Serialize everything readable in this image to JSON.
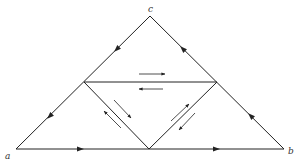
{
  "diagram": {
    "type": "subdivided-triangle",
    "colors": {
      "line": "#222222",
      "background": "#ffffff"
    },
    "vertices": {
      "a": {
        "label": "a",
        "x": 16,
        "y": 149,
        "label_x": 5,
        "label_y": 159
      },
      "b": {
        "label": "b",
        "x": 284,
        "y": 149,
        "label_x": 288,
        "label_y": 154
      },
      "c": {
        "label": "c",
        "x": 150,
        "y": 16,
        "label_x": 148,
        "label_y": 12
      }
    },
    "midpoints": {
      "ac": {
        "x": 84,
        "y": 82
      },
      "bc": {
        "x": 217,
        "y": 82
      },
      "ab": {
        "x": 149,
        "y": 149
      }
    },
    "edge_arrows": [
      {
        "name": "arrow-ca-upper",
        "x": 117,
        "y": 49,
        "angle": 135
      },
      {
        "name": "arrow-ca-lower",
        "x": 50,
        "y": 116,
        "angle": 135
      },
      {
        "name": "arrow-bc-lower",
        "x": 251,
        "y": 116,
        "angle": -135
      },
      {
        "name": "arrow-bc-upper",
        "x": 183,
        "y": 49,
        "angle": -135
      },
      {
        "name": "arrow-ab-left",
        "x": 80,
        "y": 149,
        "angle": 0
      },
      {
        "name": "arrow-ab-right",
        "x": 216,
        "y": 149,
        "angle": 0
      }
    ],
    "half_arrows": [
      {
        "name": "mid-horizontal-right",
        "x1": 139,
        "y1": 74,
        "x2": 165,
        "y2": 74
      },
      {
        "name": "mid-horizontal-left",
        "x1": 163,
        "y1": 89,
        "x2": 139,
        "y2": 89
      },
      {
        "name": "left-diagonal-down",
        "x1": 114,
        "y1": 100,
        "x2": 131,
        "y2": 118
      },
      {
        "name": "left-diagonal-up",
        "x1": 121,
        "y1": 128,
        "x2": 104,
        "y2": 111
      },
      {
        "name": "right-diagonal-up",
        "x1": 171,
        "y1": 121,
        "x2": 189,
        "y2": 104
      },
      {
        "name": "right-diagonal-down",
        "x1": 195,
        "y1": 113,
        "x2": 179,
        "y2": 130
      }
    ]
  }
}
